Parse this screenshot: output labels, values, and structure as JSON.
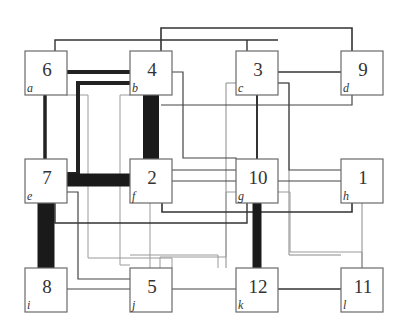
{
  "diagram": {
    "type": "grid-placement-netlist",
    "nodes": [
      {
        "id": "6",
        "letter": "a",
        "x": 25,
        "y": 51
      },
      {
        "id": "4",
        "letter": "b",
        "x": 130,
        "y": 51
      },
      {
        "id": "3",
        "letter": "c",
        "x": 236,
        "y": 51
      },
      {
        "id": "9",
        "letter": "d",
        "x": 341,
        "y": 51
      },
      {
        "id": "7",
        "letter": "e",
        "x": 25,
        "y": 159
      },
      {
        "id": "2",
        "letter": "f",
        "x": 130,
        "y": 159
      },
      {
        "id": "10",
        "letter": "g",
        "x": 236,
        "y": 159
      },
      {
        "id": "1",
        "letter": "h",
        "x": 341,
        "y": 159
      },
      {
        "id": "8",
        "letter": "i",
        "x": 25,
        "y": 268
      },
      {
        "id": "5",
        "letter": "j",
        "x": 130,
        "y": 268
      },
      {
        "id": "12",
        "letter": "k",
        "x": 236,
        "y": 268
      },
      {
        "id": "11",
        "letter": "l",
        "x": 341,
        "y": 268
      }
    ],
    "node_size": {
      "w": 42,
      "h": 44
    },
    "edges": [
      {
        "from": "6",
        "to": "3",
        "weight": "medium",
        "points": "55,51 55,40 278,40 278,40 236,40 236,40"
      },
      {
        "from": "4",
        "to": "9",
        "weight": "medium",
        "points": "161,51 161,28 383,28 383,28 352,28 352,51"
      },
      {
        "from": "6",
        "to": "4",
        "weight": "heavy",
        "points": "66,72 130,72"
      },
      {
        "from": "4",
        "to": "7",
        "weight": "heavy",
        "points": "130,83 78,83 78,174 66,174"
      },
      {
        "from": "6",
        "to": "7",
        "weight": "heavy",
        "points": "45,95 45,159"
      },
      {
        "from": "4",
        "to": "2",
        "weight": "very-heavy",
        "points": "150,95 150,159"
      },
      {
        "from": "3",
        "to": "9",
        "weight": "medium",
        "points": "278,72 341,72"
      },
      {
        "from": "3",
        "to": "10",
        "weight": "medium",
        "points": "257,95 257,159"
      },
      {
        "from": "7",
        "to": "2",
        "weight": "very-heavy",
        "points": "66,180 130,180"
      },
      {
        "from": "7",
        "to": "8",
        "weight": "very-heavy",
        "points": "45,202 45,268"
      }
    ]
  }
}
